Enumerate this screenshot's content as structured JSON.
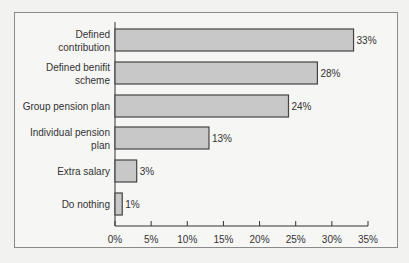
{
  "chart_data": {
    "type": "bar",
    "orientation": "horizontal",
    "title": "",
    "xlabel": "",
    "ylabel": "",
    "categories": [
      "Defined contribution",
      "Defined benifit scheme",
      "Group pension plan",
      "Individual pension plan",
      "Extra salary",
      "Do nothing"
    ],
    "category_lines": [
      [
        "Defined",
        "contribution"
      ],
      [
        "Defined benifit",
        "scheme"
      ],
      [
        "Group pension plan"
      ],
      [
        "Individual pension",
        "plan"
      ],
      [
        "Extra salary"
      ],
      [
        "Do nothing"
      ]
    ],
    "values": [
      33,
      28,
      24,
      13,
      3,
      1
    ],
    "value_labels": [
      "33%",
      "28%",
      "24%",
      "13%",
      "3%",
      "1%"
    ],
    "xlim": [
      0,
      35
    ],
    "x_ticks": [
      0,
      5,
      10,
      15,
      20,
      25,
      30,
      35
    ],
    "x_tick_labels": [
      "0%",
      "5%",
      "10%",
      "15%",
      "20%",
      "25%",
      "30%",
      "35%"
    ],
    "grid": false,
    "legend": null,
    "colors": {
      "bar_fill": "#c8c8c8",
      "bar_stroke": "#444444",
      "frame": "#8a8a8a",
      "background": "#f6f6f5"
    }
  }
}
